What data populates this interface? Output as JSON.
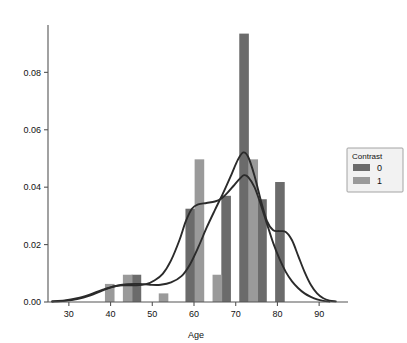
{
  "chart_data": {
    "type": "bar",
    "title": "",
    "subtitle": "",
    "xlabel": "Age",
    "ylabel": "",
    "xlim": [
      25,
      95
    ],
    "ylim": [
      0.0,
      0.0965
    ],
    "xticks": [
      30,
      40,
      50,
      60,
      70,
      80,
      90
    ],
    "xticklabels": [
      "30",
      "40",
      "50",
      "60",
      "70",
      "80",
      "90"
    ],
    "yticks": [
      0.0,
      0.02,
      0.04,
      0.06,
      0.08
    ],
    "yticklabels": [
      "0.00",
      "0.02",
      "0.04",
      "0.06",
      "0.08"
    ],
    "grid": false,
    "legend": {
      "title": "Contrast",
      "position": "right-outside",
      "entries": [
        {
          "label": "0",
          "color": "#6b6b6b"
        },
        {
          "label": "1",
          "color": "#9a9a9a"
        }
      ]
    },
    "bar_width_years": 2.3,
    "series": [
      {
        "name": "0",
        "color": "#6b6b6b",
        "bars": [
          {
            "x": 41.9,
            "value": 0.0
          },
          {
            "x": 46.2,
            "value": 0.0095
          },
          {
            "x": 50.5,
            "value": 0.0
          },
          {
            "x": 54.8,
            "value": 0.0
          },
          {
            "x": 59.1,
            "value": 0.0325
          },
          {
            "x": 63.4,
            "value": 0.0
          },
          {
            "x": 67.7,
            "value": 0.037
          },
          {
            "x": 72.0,
            "value": 0.0935
          },
          {
            "x": 76.3,
            "value": 0.0358
          },
          {
            "x": 80.6,
            "value": 0.0418
          },
          {
            "x": 84.9,
            "value": 0.0
          }
        ]
      },
      {
        "name": "1",
        "color": "#9a9a9a",
        "bars": [
          {
            "x": 39.8,
            "value": 0.0063
          },
          {
            "x": 44.1,
            "value": 0.0095
          },
          {
            "x": 48.4,
            "value": 0.0
          },
          {
            "x": 52.7,
            "value": 0.003
          },
          {
            "x": 57.0,
            "value": 0.0
          },
          {
            "x": 61.3,
            "value": 0.0497
          },
          {
            "x": 65.6,
            "value": 0.0095
          },
          {
            "x": 69.9,
            "value": 0.0
          },
          {
            "x": 74.2,
            "value": 0.0497
          },
          {
            "x": 78.5,
            "value": 0.0
          },
          {
            "x": 82.8,
            "value": 0.0
          }
        ]
      }
    ],
    "kde_curves": [
      {
        "name": "0",
        "color": "#2b2b2b",
        "points": [
          [
            26.0,
            0.0002
          ],
          [
            29.0,
            0.0004
          ],
          [
            32.0,
            0.001
          ],
          [
            35.0,
            0.0022
          ],
          [
            38.0,
            0.004
          ],
          [
            41.0,
            0.0055
          ],
          [
            44.0,
            0.0062
          ],
          [
            47.0,
            0.0063
          ],
          [
            49.5,
            0.006
          ],
          [
            52.0,
            0.006
          ],
          [
            54.5,
            0.0068
          ],
          [
            57.0,
            0.009
          ],
          [
            59.0,
            0.013
          ],
          [
            61.0,
            0.019
          ],
          [
            63.0,
            0.0258
          ],
          [
            65.0,
            0.032
          ],
          [
            67.0,
            0.038
          ],
          [
            69.0,
            0.0445
          ],
          [
            70.5,
            0.0495
          ],
          [
            71.8,
            0.0521
          ],
          [
            73.0,
            0.0505
          ],
          [
            74.5,
            0.044
          ],
          [
            76.0,
            0.0355
          ],
          [
            77.5,
            0.0282
          ],
          [
            79.0,
            0.025
          ],
          [
            80.5,
            0.0247
          ],
          [
            82.0,
            0.0244
          ],
          [
            83.5,
            0.0215
          ],
          [
            85.0,
            0.016
          ],
          [
            86.5,
            0.0105
          ],
          [
            88.0,
            0.006
          ],
          [
            89.5,
            0.003
          ],
          [
            91.0,
            0.0013
          ],
          [
            92.5,
            0.0005
          ],
          [
            94.0,
            0.0002
          ]
        ]
      },
      {
        "name": "1",
        "color": "#2b2b2b",
        "points": [
          [
            26.0,
            0.0002
          ],
          [
            29.0,
            0.0005
          ],
          [
            32.0,
            0.0013
          ],
          [
            35.0,
            0.0026
          ],
          [
            38.0,
            0.0042
          ],
          [
            41.0,
            0.0055
          ],
          [
            43.5,
            0.0058
          ],
          [
            46.0,
            0.0058
          ],
          [
            48.5,
            0.0062
          ],
          [
            50.5,
            0.0075
          ],
          [
            52.5,
            0.0098
          ],
          [
            54.5,
            0.0145
          ],
          [
            56.5,
            0.0215
          ],
          [
            58.0,
            0.028
          ],
          [
            59.5,
            0.0325
          ],
          [
            61.0,
            0.034
          ],
          [
            63.0,
            0.0345
          ],
          [
            65.0,
            0.035
          ],
          [
            66.5,
            0.036
          ],
          [
            68.0,
            0.038
          ],
          [
            69.5,
            0.0405
          ],
          [
            71.0,
            0.043
          ],
          [
            72.0,
            0.0442
          ],
          [
            73.0,
            0.0435
          ],
          [
            74.5,
            0.04
          ],
          [
            76.0,
            0.034
          ],
          [
            77.5,
            0.0272
          ],
          [
            79.0,
            0.0205
          ],
          [
            80.5,
            0.015
          ],
          [
            82.0,
            0.0105
          ],
          [
            83.5,
            0.0072
          ],
          [
            85.0,
            0.0048
          ],
          [
            86.5,
            0.003
          ],
          [
            88.0,
            0.0018
          ],
          [
            89.5,
            0.0009
          ],
          [
            91.0,
            0.0004
          ],
          [
            92.5,
            0.0002
          ]
        ]
      }
    ]
  },
  "axes": {
    "x_title": "Age",
    "y_title": ""
  }
}
